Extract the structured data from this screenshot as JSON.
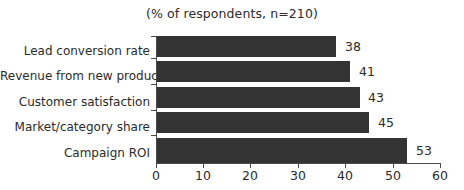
{
  "chart_data": {
    "type": "bar",
    "orientation": "horizontal",
    "title": "(% of respondents, n=210)",
    "xlabel": "",
    "ylabel": "",
    "categories": [
      "Lead conversion rate",
      "Revenue from new products",
      "Customer satisfaction",
      "Market/category share",
      "Campaign ROI"
    ],
    "values": [
      38,
      41,
      43,
      45,
      53
    ],
    "value_labels": [
      "38",
      "41",
      "43",
      "45",
      "53"
    ],
    "xlim": [
      0,
      60
    ],
    "xticks": [
      0,
      10,
      20,
      30,
      40,
      50,
      60
    ],
    "xtick_labels": [
      "0",
      "10",
      "20",
      "30",
      "40",
      "50",
      "60"
    ],
    "grid": false,
    "legend": false,
    "bar_color": "#333333",
    "text_color": "#2b2b2b",
    "axis_color": "#4a4a4a",
    "background": "#ffffff"
  }
}
